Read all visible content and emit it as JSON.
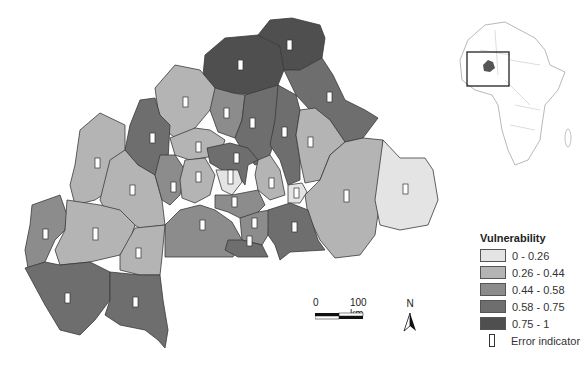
{
  "map": {
    "title": "Vulnerability map of Burkina Faso provinces",
    "classes": [
      {
        "label": "0 - 0.26",
        "color": "#e4e4e4"
      },
      {
        "label": "0.26 - 0.44",
        "color": "#b4b4b4"
      },
      {
        "label": "0.44 - 0.58",
        "color": "#8c8c8c"
      },
      {
        "label": "0.58 - 0.75",
        "color": "#6e6e6e"
      },
      {
        "label": "0.75 - 1",
        "color": "#4f4f4f"
      }
    ]
  },
  "legend": {
    "title": "Vulnerability",
    "items": [
      {
        "label": "0 - 0.26",
        "color": "#e4e4e4"
      },
      {
        "label": "0.26 - 0.44",
        "color": "#b4b4b4"
      },
      {
        "label": "0.44 - 0.58",
        "color": "#8c8c8c"
      },
      {
        "label": "0.58 - 0.75",
        "color": "#6e6e6e"
      },
      {
        "label": "0.75 - 1",
        "color": "#4f4f4f"
      }
    ],
    "error_indicator_label": "Error indicator"
  },
  "scale_bar": {
    "start_label": "0",
    "end_label": "100 km"
  },
  "north_arrow": {
    "label": "N"
  },
  "inset": {
    "description": "Africa locator map with Burkina Faso highlighted"
  }
}
